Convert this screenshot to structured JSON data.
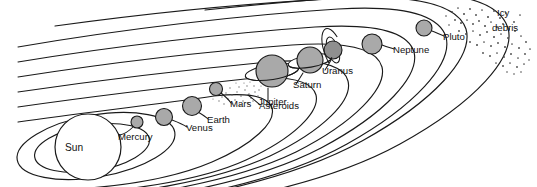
{
  "diagram": {
    "type": "schematic-orbital-diagram",
    "background_color": "#ffffff",
    "line_color": "#1a1a1a",
    "planet_fill": "#a9a9a9",
    "planet_stroke": "#1a1a1a",
    "sun_fill": "#ffffff",
    "sun_stroke": "#1a1a1a",
    "label_color": "#111111"
  },
  "labels": {
    "sun": "Sun",
    "mercury": "Mercury",
    "venus": "Venus",
    "earth": "Earth",
    "mars": "Mars",
    "asteroids": "Asteroids",
    "jupiter": "Jupiter",
    "saturn": "Saturn",
    "uranus": "Uranus",
    "neptune": "Neptune",
    "pluto": "Pluto",
    "icy_debris_line1": "Icy",
    "icy_debris_line2": "debris"
  },
  "bodies": [
    {
      "name": "Sun",
      "cx": 88,
      "cy": 147,
      "r": 33,
      "fill": "#ffffff",
      "rings": "none"
    },
    {
      "name": "Mercury",
      "cx": 137,
      "cy": 122,
      "r": 6,
      "fill": "#a9a9a9",
      "rings": "none"
    },
    {
      "name": "Venus",
      "cx": 164,
      "cy": 117,
      "r": 8.5,
      "fill": "#a9a9a9",
      "rings": "none"
    },
    {
      "name": "Earth",
      "cx": 192,
      "cy": 106,
      "r": 9.5,
      "fill": "#a9a9a9",
      "rings": "none"
    },
    {
      "name": "Mars",
      "cx": 216,
      "cy": 89,
      "r": 6.5,
      "fill": "#a9a9a9",
      "rings": "none"
    },
    {
      "name": "Jupiter",
      "cx": 272,
      "cy": 71,
      "r": 16,
      "fill": "#a9a9a9",
      "rings": "horizontal"
    },
    {
      "name": "Saturn",
      "cx": 310,
      "cy": 60,
      "r": 13,
      "fill": "#a9a9a9",
      "rings": "horizontal"
    },
    {
      "name": "Uranus",
      "cx": 333,
      "cy": 50,
      "r": 9,
      "fill": "#8f8f8f",
      "rings": "vertical"
    },
    {
      "name": "Neptune",
      "cx": 372,
      "cy": 44,
      "r": 10,
      "fill": "#a9a9a9",
      "rings": "none"
    },
    {
      "name": "Pluto",
      "cx": 424,
      "cy": 28,
      "r": 8,
      "fill": "#a9a9a9",
      "rings": "none"
    }
  ],
  "features": {
    "orbit_count": 10,
    "asteroid_belt": "dotted band between Mars and Jupiter",
    "icy_debris": "scattered dot field in upper right beyond Pluto"
  }
}
